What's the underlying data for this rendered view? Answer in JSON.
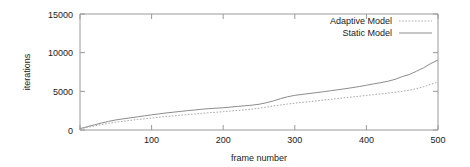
{
  "chart_data": {
    "type": "line",
    "title": "",
    "xlabel": "frame number",
    "ylabel": "iterations",
    "xlim": [
      0,
      500
    ],
    "ylim": [
      0,
      15000
    ],
    "grid": false,
    "legend_position": "top-right-inside",
    "xticks": [
      0,
      100,
      200,
      300,
      400,
      500
    ],
    "xtick_labels": [
      "",
      "100",
      "200",
      "300",
      "400",
      "500"
    ],
    "yticks": [
      0,
      5000,
      10000,
      15000
    ],
    "ytick_labels": [
      "0",
      "5000",
      "10000",
      "15000"
    ],
    "x": [
      0,
      10,
      20,
      30,
      40,
      50,
      60,
      70,
      80,
      90,
      100,
      110,
      120,
      130,
      140,
      150,
      160,
      170,
      180,
      190,
      200,
      210,
      220,
      230,
      240,
      250,
      260,
      270,
      280,
      290,
      300,
      310,
      320,
      330,
      340,
      350,
      360,
      370,
      380,
      390,
      400,
      410,
      420,
      430,
      440,
      450,
      460,
      470,
      480,
      490,
      500
    ],
    "series": [
      {
        "name": "Static Model",
        "style": "solid",
        "color": "#8c8c8c",
        "values": [
          180,
          420,
          660,
          900,
          1120,
          1300,
          1440,
          1570,
          1700,
          1830,
          1960,
          2080,
          2200,
          2300,
          2400,
          2500,
          2590,
          2680,
          2760,
          2820,
          2880,
          2960,
          3050,
          3130,
          3210,
          3330,
          3520,
          3760,
          4050,
          4300,
          4480,
          4600,
          4720,
          4830,
          4950,
          5080,
          5200,
          5330,
          5470,
          5620,
          5790,
          5960,
          6120,
          6300,
          6550,
          6900,
          7180,
          7600,
          8050,
          8600,
          9050
        ]
      },
      {
        "name": "Adaptive Model",
        "style": "dotted",
        "color": "#a8a8a8",
        "values": [
          140,
          330,
          520,
          700,
          870,
          1010,
          1130,
          1240,
          1350,
          1450,
          1550,
          1650,
          1740,
          1830,
          1910,
          1990,
          2070,
          2150,
          2230,
          2300,
          2370,
          2450,
          2530,
          2610,
          2700,
          2820,
          2960,
          3100,
          3240,
          3360,
          3470,
          3570,
          3670,
          3770,
          3870,
          3970,
          4070,
          4170,
          4270,
          4370,
          4470,
          4570,
          4670,
          4770,
          4880,
          5000,
          5150,
          5350,
          5600,
          5900,
          6220
        ]
      }
    ]
  },
  "legend": {
    "entries": [
      {
        "label": "Adaptive Model"
      },
      {
        "label": "Static Model"
      }
    ]
  }
}
